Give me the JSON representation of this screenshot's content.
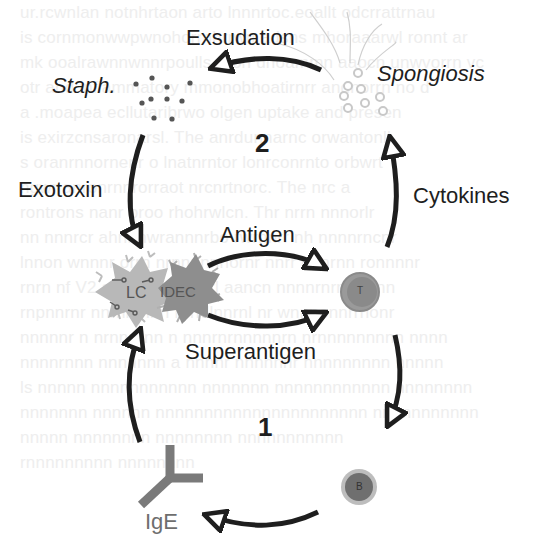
{
  "diagram": {
    "labels": {
      "exsudation": "Exsudation",
      "staph": "Staph.",
      "spongiosis": "Spongiosis",
      "cycle_2": "2",
      "exotoxin": "Exotoxin",
      "cytokines": "Cytokines",
      "antigen": "Antigen",
      "superantigen": "Superantigen",
      "cycle_1": "1",
      "ige": "IgE"
    },
    "cells": {
      "lc": "LC",
      "idec": "IDEC",
      "t_cell": "T",
      "b_cell": "B"
    },
    "colors": {
      "arrow": "#1e1e1e",
      "lc_cell": "#b4b4b4",
      "idec_cell": "#8c8c8c",
      "t_cell": "#8a8a8a",
      "b_cell": "#6f6f6f",
      "ige": "#7a7a7a",
      "staph_dots": "#555555",
      "spongiosis_rings": "#c8c8c8"
    }
  }
}
